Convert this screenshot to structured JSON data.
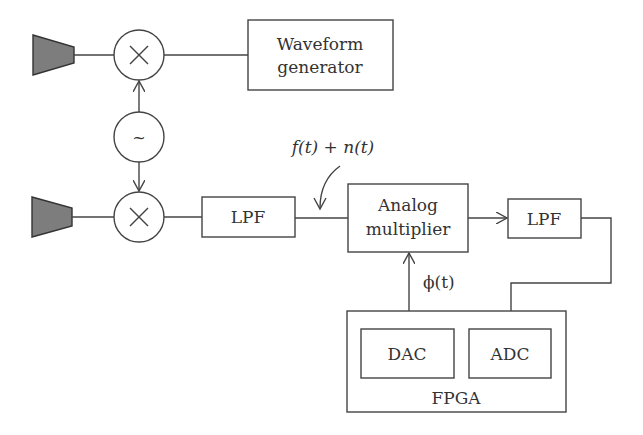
{
  "diagram": {
    "type": "block-diagram",
    "colors": {
      "line": "#444444",
      "antenna_fill": "#7d7d7d",
      "background": "#ffffff"
    },
    "nodes": {
      "antenna_top": {
        "label": "",
        "kind": "antenna"
      },
      "mixer_top": {
        "label": "×",
        "kind": "mixer"
      },
      "waveform_generator": {
        "line1": "Waveform",
        "line2": "generator"
      },
      "oscillator": {
        "label": "~",
        "kind": "local-oscillator"
      },
      "antenna_bottom": {
        "label": "",
        "kind": "antenna"
      },
      "mixer_bottom": {
        "label": "×",
        "kind": "mixer"
      },
      "lpf1": {
        "label": "LPF"
      },
      "analog_multiplier": {
        "line1": "Analog",
        "line2": "multiplier"
      },
      "lpf2": {
        "label": "LPF"
      },
      "fpga": {
        "label": "FPGA"
      },
      "dac": {
        "label": "DAC"
      },
      "adc": {
        "label": "ADC"
      }
    },
    "annotations": {
      "signal_label": "f(t) + n(t)",
      "phase_label": "ϕ(t)"
    },
    "edges": [
      {
        "from": "antenna_top",
        "to": "mixer_top"
      },
      {
        "from": "mixer_top",
        "to": "waveform_generator"
      },
      {
        "from": "oscillator",
        "to": "mixer_top",
        "arrow": true
      },
      {
        "from": "oscillator",
        "to": "mixer_bottom",
        "arrow": true
      },
      {
        "from": "antenna_bottom",
        "to": "mixer_bottom"
      },
      {
        "from": "mixer_bottom",
        "to": "lpf1"
      },
      {
        "from": "lpf1",
        "to": "analog_multiplier",
        "label": "f(t) + n(t)"
      },
      {
        "from": "analog_multiplier",
        "to": "lpf2",
        "arrow": true
      },
      {
        "from": "lpf2",
        "to": "adc",
        "arrow": true
      },
      {
        "from": "dac",
        "to": "analog_multiplier",
        "arrow": true,
        "label": "ϕ(t)"
      }
    ]
  }
}
